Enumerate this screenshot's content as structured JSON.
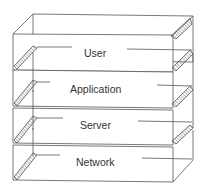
{
  "diagram": {
    "title": "",
    "type": "layered-stack",
    "layers": [
      {
        "label": "User"
      },
      {
        "label": "Application"
      },
      {
        "label": "Server"
      },
      {
        "label": "Network"
      }
    ],
    "colors": {
      "line": "#555555",
      "hatch": "#777777",
      "background": "#ffffff"
    }
  }
}
